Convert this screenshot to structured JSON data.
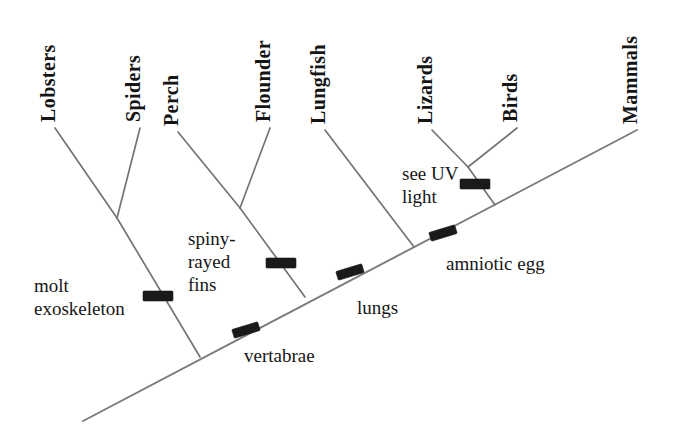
{
  "figure": {
    "kind": "cladogram",
    "background_color": "#ffffff",
    "line_color": "#747474",
    "tick_color": "#1a1a1a",
    "text_color": "#151515"
  },
  "taxa": [
    {
      "id": "lobsters",
      "label": "Lobsters",
      "tip_x": 55,
      "tip_y": 128,
      "label_x": 55,
      "label_y": 122
    },
    {
      "id": "spiders",
      "label": "Spiders",
      "tip_x": 140,
      "tip_y": 128,
      "label_x": 140,
      "label_y": 122
    },
    {
      "id": "perch",
      "label": "Perch",
      "tip_x": 178,
      "tip_y": 132,
      "label_x": 178,
      "label_y": 126
    },
    {
      "id": "flounder",
      "label": "Flounder",
      "tip_x": 270,
      "tip_y": 128,
      "label_x": 270,
      "label_y": 122
    },
    {
      "id": "lungfish",
      "label": "Lungfish",
      "tip_x": 325,
      "tip_y": 130,
      "label_x": 325,
      "label_y": 124
    },
    {
      "id": "lizards",
      "label": "Lizards",
      "tip_x": 432,
      "tip_y": 130,
      "label_x": 432,
      "label_y": 124
    },
    {
      "id": "birds",
      "label": "Birds",
      "tip_x": 517,
      "tip_y": 128,
      "label_x": 517,
      "label_y": 122
    },
    {
      "id": "mammals",
      "label": "Mammals",
      "tip_x": 637,
      "tip_y": 130,
      "label_x": 637,
      "label_y": 124
    }
  ],
  "traits": [
    {
      "id": "molt-exoskeleton",
      "label_line1": "molt",
      "label_line2": "exoskeleton",
      "label_x": 34,
      "label_y": 292,
      "tick_x": 158,
      "tick_y": 296,
      "tick_angle": 0,
      "tick_style": "horizontal-bar"
    },
    {
      "id": "spiny-rayed-fins",
      "label_line1": "spiny-",
      "label_line2": "rayed",
      "label_line3": "fins",
      "label_x": 188,
      "label_y": 245,
      "tick_x": 281,
      "tick_y": 263,
      "tick_angle": 0,
      "tick_style": "horizontal-bar"
    },
    {
      "id": "vertabrae",
      "label_line1": "vertabrae",
      "label_x": 244,
      "label_y": 362,
      "tick_x": 246,
      "tick_y": 330,
      "tick_angle": 73,
      "tick_style": "steep-bar"
    },
    {
      "id": "lungs",
      "label_line1": "lungs",
      "label_x": 357,
      "label_y": 314,
      "tick_x": 350,
      "tick_y": 272,
      "tick_angle": 73,
      "tick_style": "steep-bar"
    },
    {
      "id": "see-uv-light",
      "label_line1": "see UV",
      "label_line2": "light",
      "label_x": 402,
      "label_y": 180,
      "tick_x": 475,
      "tick_y": 184,
      "tick_angle": 0,
      "tick_style": "horizontal-bar"
    },
    {
      "id": "amniotic-egg",
      "label_line1": "amniotic egg",
      "label_x": 446,
      "label_y": 270,
      "tick_x": 443,
      "tick_y": 233,
      "tick_angle": 73,
      "tick_style": "steep-bar"
    }
  ],
  "trunk": {
    "id": "main-trunk",
    "from_x": 83,
    "from_y": 421,
    "to_x": 637,
    "to_y": 130
  },
  "internal_nodes": [
    {
      "id": "arthropod-node",
      "x": 117,
      "y": 218,
      "joins_trunk_x": 200,
      "joins_trunk_y": 357
    },
    {
      "id": "ray-finned-node",
      "x": 240,
      "y": 208,
      "joins_trunk_x": 305,
      "joins_trunk_y": 297
    },
    {
      "id": "lungfish-join",
      "x": 414,
      "y": 247
    },
    {
      "id": "amniote-node",
      "x": 468,
      "y": 167,
      "joins_trunk_x": 495,
      "joins_trunk_y": 205
    }
  ],
  "branches": [
    {
      "id": "lobsters-branch",
      "x1": 55,
      "y1": 128,
      "x2": 117,
      "y2": 218
    },
    {
      "id": "spiders-branch",
      "x1": 140,
      "y1": 128,
      "x2": 117,
      "y2": 218
    },
    {
      "id": "arthropod-stem",
      "x1": 117,
      "y1": 218,
      "x2": 200,
      "y2": 357
    },
    {
      "id": "perch-branch",
      "x1": 178,
      "y1": 132,
      "x2": 240,
      "y2": 208
    },
    {
      "id": "flounder-branch",
      "x1": 270,
      "y1": 128,
      "x2": 240,
      "y2": 208
    },
    {
      "id": "rayfin-stem",
      "x1": 240,
      "y1": 208,
      "x2": 305,
      "y2": 297
    },
    {
      "id": "lungfish-branch",
      "x1": 325,
      "y1": 130,
      "x2": 414,
      "y2": 247
    },
    {
      "id": "lizards-branch",
      "x1": 432,
      "y1": 130,
      "x2": 468,
      "y2": 167
    },
    {
      "id": "birds-branch",
      "x1": 517,
      "y1": 128,
      "x2": 468,
      "y2": 167
    },
    {
      "id": "amniote-stem",
      "x1": 468,
      "y1": 167,
      "x2": 495,
      "y2": 205
    }
  ]
}
